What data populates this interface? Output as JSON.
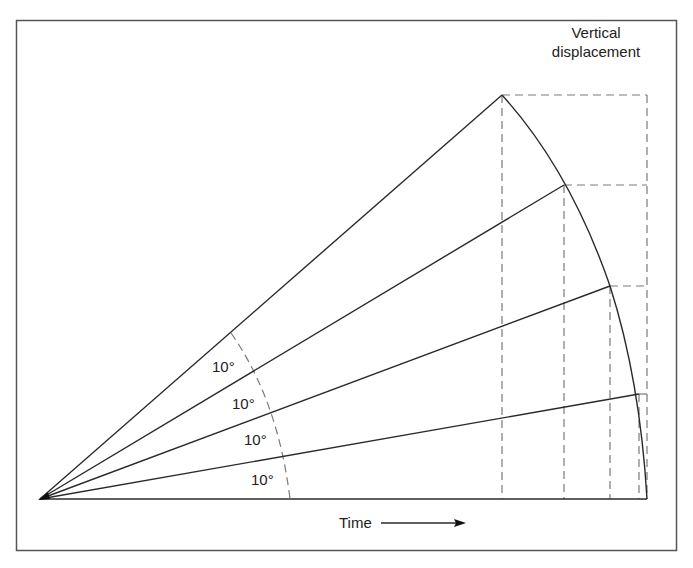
{
  "diagram": {
    "title_line1": "Vertical",
    "title_line2": "displacement",
    "x_axis_label": "Time",
    "angle_labels": [
      "10°",
      "10°",
      "10°",
      "10°"
    ],
    "angle_step_degrees": 10,
    "num_rays": 4,
    "colors": {
      "line": "#2a2a2a",
      "dashed": "#7a7a7a",
      "frame": "#555555",
      "background": "#ffffff"
    }
  }
}
